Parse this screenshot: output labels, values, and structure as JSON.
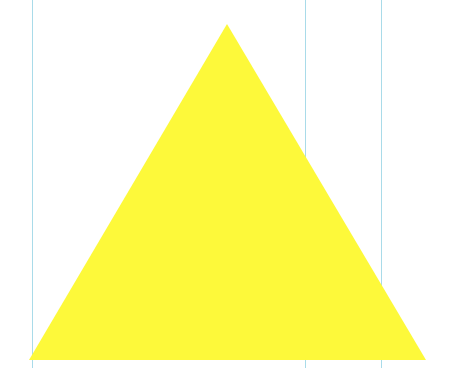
{
  "canvas": {
    "width": 457,
    "height": 368,
    "background": "#ffffff"
  },
  "guides": [
    {
      "x": 32,
      "color": "#a9dbe9"
    },
    {
      "x": 305,
      "color": "#a9dbe9"
    },
    {
      "x": 381,
      "color": "#a9dbe9"
    }
  ],
  "shape": {
    "type": "triangle",
    "fill": "#fdf93a",
    "points": [
      [
        227,
        24
      ],
      [
        29,
        360
      ],
      [
        426,
        360
      ]
    ]
  }
}
